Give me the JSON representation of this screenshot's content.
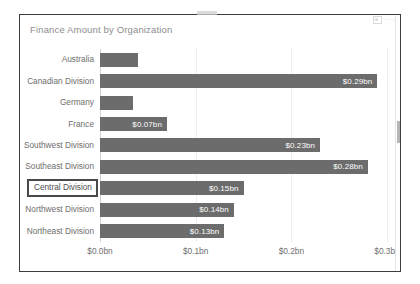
{
  "visual": {
    "title": "Finance Amount by Organization",
    "header_icons": [
      {
        "name": "focus-mode-icon",
        "glyph": ""
      },
      {
        "name": "more-options-icon",
        "glyph": "···"
      }
    ],
    "top_handle_name": "resize-handle"
  },
  "colors": {
    "bar": "#6c6c6c",
    "bar_data_label": "#ffffff",
    "axis_text": "#6e6e6e",
    "title_text": "#8e8e8e",
    "gridline": "#ededed",
    "selection_outline": "#4a4a4a",
    "frame_border": "#3d3d3d",
    "scrollbar_thumb": "#b6b6b6"
  },
  "chart_data": {
    "type": "bar",
    "orientation": "horizontal",
    "title": "Finance Amount by Organization",
    "xlabel": "",
    "ylabel": "",
    "xlim": [
      0,
      0.3
    ],
    "grid": true,
    "legend": "none",
    "xtick_labels": [
      "$0.0bn",
      "$0.1bn",
      "$0.2bn",
      "$0.3bn"
    ],
    "xtick_values": [
      0,
      0.1,
      0.2,
      0.3
    ],
    "categories": [
      "Australia",
      "Canadian Division",
      "Germany",
      "France",
      "Southwest Division",
      "Southeast Division",
      "Central Division",
      "Northwest Division",
      "Northeast Division"
    ],
    "values": [
      0.04,
      0.29,
      0.035,
      0.07,
      0.23,
      0.28,
      0.15,
      0.14,
      0.13
    ],
    "data_labels": [
      "",
      "$0.29bn",
      "",
      "$0.07bn",
      "$0.23bn",
      "$0.28bn",
      "$0.15bn",
      "$0.14bn",
      "$0.13bn"
    ],
    "selected_category": "Central Division"
  }
}
